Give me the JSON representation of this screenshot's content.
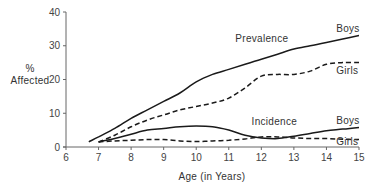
{
  "chart_data": {
    "type": "line",
    "title": "",
    "xlabel": "Age (in Years)",
    "ylabel": "% Affected",
    "ylabel_lines": [
      "%",
      "Affected"
    ],
    "xlim": [
      6,
      15
    ],
    "ylim": [
      0,
      40
    ],
    "x_ticks": [
      6,
      7,
      8,
      9,
      10,
      11,
      12,
      13,
      14,
      15
    ],
    "y_ticks": [
      0,
      10,
      20,
      30,
      40
    ],
    "grid": false,
    "legend": "inline labels",
    "annotations": [
      {
        "text": "Prevalence",
        "x": 11.2,
        "y": 31
      },
      {
        "text": "Incidence",
        "x": 11.7,
        "y": 6.5
      },
      {
        "text": "Boys",
        "x": 14.3,
        "y": 34
      },
      {
        "text": "Girls",
        "x": 14.3,
        "y": 21.5
      },
      {
        "text": "Boys",
        "x": 14.3,
        "y": 6.7
      },
      {
        "text": "Girls",
        "x": 14.3,
        "y": 0.5
      }
    ],
    "series": [
      {
        "name": "Prevalence - Boys",
        "style": "solid",
        "x": [
          6.7,
          7,
          7.5,
          8,
          8.5,
          9,
          9.5,
          10,
          10.5,
          11,
          11.5,
          12,
          12.5,
          13,
          13.5,
          14,
          14.5,
          15
        ],
        "values": [
          1.5,
          3,
          5.5,
          8.5,
          11,
          13.5,
          16,
          19.3,
          21.5,
          23,
          24.5,
          26,
          27.5,
          29,
          30,
          31,
          32,
          33
        ]
      },
      {
        "name": "Prevalence - Girls",
        "style": "dashed",
        "x": [
          7,
          7.5,
          8,
          8.5,
          9,
          9.5,
          10,
          10.5,
          11,
          11.5,
          12,
          12.5,
          13,
          13.5,
          14,
          14.5,
          15
        ],
        "values": [
          1.5,
          3.5,
          6,
          8,
          9.5,
          11,
          12,
          13,
          14.5,
          17.5,
          21,
          21.5,
          21.5,
          22.5,
          24.5,
          25,
          25
        ]
      },
      {
        "name": "Incidence - Boys",
        "style": "solid",
        "x": [
          7,
          7.5,
          8,
          8.5,
          9,
          9.5,
          10,
          10.5,
          11,
          11.5,
          12,
          12.5,
          13,
          13.5,
          14,
          14.5,
          15
        ],
        "values": [
          1.5,
          2.5,
          3.8,
          5,
          5.5,
          6,
          6.2,
          6,
          5,
          3.5,
          2.7,
          2.5,
          3.2,
          4,
          4.8,
          5.3,
          5.8
        ]
      },
      {
        "name": "Incidence - Girls",
        "style": "dashed",
        "x": [
          7,
          7.5,
          8,
          8.5,
          9,
          9.5,
          10,
          10.5,
          11,
          11.5,
          12,
          12.5,
          13,
          13.5,
          14,
          14.5,
          15
        ],
        "values": [
          1.5,
          1.8,
          2,
          2.2,
          2.2,
          1.8,
          1.6,
          1.8,
          2,
          2.4,
          3,
          3,
          2.7,
          2.5,
          2.5,
          2.3,
          2.2
        ]
      }
    ]
  }
}
